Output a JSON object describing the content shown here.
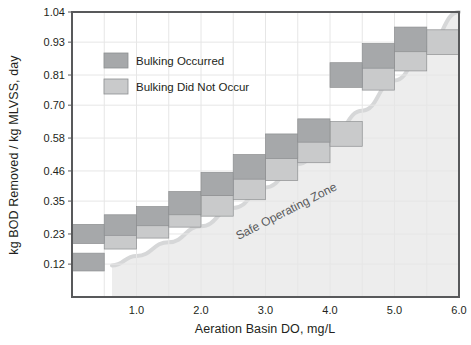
{
  "chart_data": {
    "type": "bar",
    "title": "",
    "xlabel": "Aeration Basin DO, mg/L",
    "ylabel": "kg BOD Removed / kg MLVSS, day",
    "xlim": [
      0,
      6.0
    ],
    "ylim": [
      0,
      1.04
    ],
    "grid": true,
    "x_ticks": [
      "1.0",
      "2.0",
      "3.0",
      "4.0",
      "5.0",
      "6.0"
    ],
    "x_tick_values": [
      1.0,
      2.0,
      3.0,
      4.0,
      5.0,
      6.0
    ],
    "x_minor_step": 0.5,
    "y_ticks": [
      "0.12",
      "0.23",
      "0.35",
      "0.46",
      "0.58",
      "0.70",
      "0.81",
      "0.93",
      "1.04"
    ],
    "y_tick_values": [
      0.12,
      0.23,
      0.35,
      0.46,
      0.58,
      0.7,
      0.81,
      0.93,
      1.04
    ],
    "legend": {
      "position": "upper-left-inside",
      "entries": [
        {
          "label": "Bulking Occurred",
          "color": "#a6a8aa"
        },
        {
          "label": "Bulking Did Not Occur",
          "color": "#c9cacb"
        }
      ]
    },
    "annotations": [
      {
        "text": "Safe Operating Zone",
        "x": 3.35,
        "y": 0.3,
        "rotation": -27,
        "color": "#58595b"
      }
    ],
    "series": [
      {
        "name": "Bulking Occurred",
        "color": "#a6a8aa",
        "bars": [
          {
            "x0": 0.0,
            "x1": 0.5,
            "y0": 0.195,
            "y1": 0.265
          },
          {
            "x0": 0.0,
            "x1": 0.5,
            "y0": 0.095,
            "y1": 0.16
          },
          {
            "x0": 0.5,
            "x1": 1.0,
            "y0": 0.225,
            "y1": 0.3
          },
          {
            "x0": 1.0,
            "x1": 1.5,
            "y0": 0.26,
            "y1": 0.33
          },
          {
            "x0": 1.5,
            "x1": 2.0,
            "y0": 0.3,
            "y1": 0.385
          },
          {
            "x0": 2.0,
            "x1": 2.5,
            "y0": 0.37,
            "y1": 0.455
          },
          {
            "x0": 2.5,
            "x1": 3.0,
            "y0": 0.43,
            "y1": 0.52
          },
          {
            "x0": 3.0,
            "x1": 3.5,
            "y0": 0.505,
            "y1": 0.595
          },
          {
            "x0": 3.5,
            "x1": 4.0,
            "y0": 0.565,
            "y1": 0.65
          },
          {
            "x0": 4.0,
            "x1": 4.5,
            "y0": 0.765,
            "y1": 0.855
          },
          {
            "x0": 4.5,
            "x1": 5.0,
            "y0": 0.835,
            "y1": 0.925
          },
          {
            "x0": 5.0,
            "x1": 5.5,
            "y0": 0.895,
            "y1": 0.985
          }
        ]
      },
      {
        "name": "Bulking Did Not Occur",
        "color": "#c9cacb",
        "bars": [
          {
            "x0": 0.5,
            "x1": 1.0,
            "y0": 0.175,
            "y1": 0.25
          },
          {
            "x0": 1.0,
            "x1": 1.5,
            "y0": 0.215,
            "y1": 0.285
          },
          {
            "x0": 1.5,
            "x1": 2.0,
            "y0": 0.255,
            "y1": 0.32
          },
          {
            "x0": 2.0,
            "x1": 2.5,
            "y0": 0.295,
            "y1": 0.37
          },
          {
            "x0": 2.5,
            "x1": 3.0,
            "y0": 0.355,
            "y1": 0.44
          },
          {
            "x0": 3.0,
            "x1": 3.5,
            "y0": 0.425,
            "y1": 0.51
          },
          {
            "x0": 3.5,
            "x1": 4.0,
            "y0": 0.49,
            "y1": 0.58
          },
          {
            "x0": 4.0,
            "x1": 4.5,
            "y0": 0.55,
            "y1": 0.64
          },
          {
            "x0": 4.5,
            "x1": 5.0,
            "y0": 0.755,
            "y1": 0.845
          },
          {
            "x0": 5.0,
            "x1": 5.5,
            "y0": 0.825,
            "y1": 0.915
          },
          {
            "x0": 5.5,
            "x1": 6.0,
            "y0": 0.885,
            "y1": 0.975
          }
        ]
      }
    ],
    "safe_zone": {
      "label": "Safe Operating Zone",
      "fill": "#ededed",
      "edge_color": "#d6d7d8",
      "boundary_points": [
        {
          "x": 0.62,
          "y": 0.115
        },
        {
          "x": 1.0,
          "y": 0.15
        },
        {
          "x": 1.5,
          "y": 0.2
        },
        {
          "x": 2.0,
          "y": 0.258
        },
        {
          "x": 2.5,
          "y": 0.325
        },
        {
          "x": 3.0,
          "y": 0.4
        },
        {
          "x": 3.5,
          "y": 0.485
        },
        {
          "x": 4.0,
          "y": 0.578
        },
        {
          "x": 4.5,
          "y": 0.68
        },
        {
          "x": 5.0,
          "y": 0.79
        },
        {
          "x": 5.5,
          "y": 0.912
        },
        {
          "x": 6.0,
          "y": 1.04
        }
      ]
    }
  },
  "axes": {
    "frame_color": "#58595b",
    "gridline_color": "#e6e6e6"
  }
}
